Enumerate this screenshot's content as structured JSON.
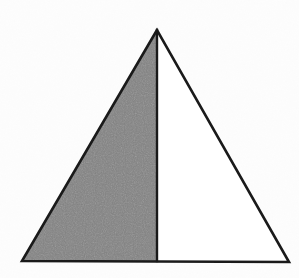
{
  "figure": {
    "title": "Isosceles triangle divided by its vertical median with the left half shaded",
    "background_color": "#fdfdfd",
    "outline_color": "#1a1a1a",
    "outline_width": 2,
    "shaded_fill_color": "#7f7f7f",
    "unshaded_fill_color": "#ffffff",
    "canvas": {
      "width": 299,
      "height": 278
    },
    "vertices": {
      "apex": {
        "label": "apex",
        "x": 157,
        "y": 30
      },
      "bottom_left": {
        "label": "bottom-left",
        "x": 22,
        "y": 261
      },
      "bottom_right": {
        "label": "bottom-right",
        "x": 289,
        "y": 262
      },
      "median_foot": {
        "label": "median-foot",
        "x": 157,
        "y": 261
      }
    },
    "regions": [
      {
        "name": "left-half",
        "shaded": true,
        "fill": "#7f7f7f",
        "points": "157,30 22,261 157,261"
      },
      {
        "name": "right-half",
        "shaded": false,
        "fill": "#ffffff",
        "points": "157,30 157,262 289,262"
      }
    ],
    "median_line": {
      "name": "vertical-median",
      "x1": 157,
      "y1": 30,
      "x2": 157,
      "y2": 261
    },
    "outline_path": "157,30 22,261 289,262"
  }
}
